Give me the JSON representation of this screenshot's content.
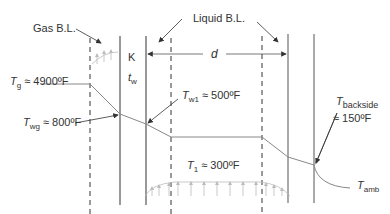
{
  "diagram": {
    "labels": {
      "gas_bl": "Gas B.L.",
      "liquid_bl": "Liquid B.L.",
      "k": "K",
      "tw_t": "t",
      "tw_sub": "w",
      "d": "d",
      "tg_T": "T",
      "tg_sub": "g",
      "tg_val": "≈ 4900ºF",
      "twg_T": "T",
      "twg_sub": "wg",
      "twg_val": "≈ 800ºF",
      "tw1_T": "T",
      "tw1_sub": "w1",
      "tw1_val": "≈ 500ºF",
      "t1_T": "T",
      "t1_sub": "1",
      "t1_val": "≈ 300ºF",
      "tback_T": "T",
      "tback_sub": "backside",
      "tback_val": "≈ 150ºF",
      "tamb_T": "T",
      "tamb_sub": "amb"
    },
    "colors": {
      "line": "#333333",
      "profile": "#888888",
      "arrows_light": "#bbbbbb"
    }
  }
}
